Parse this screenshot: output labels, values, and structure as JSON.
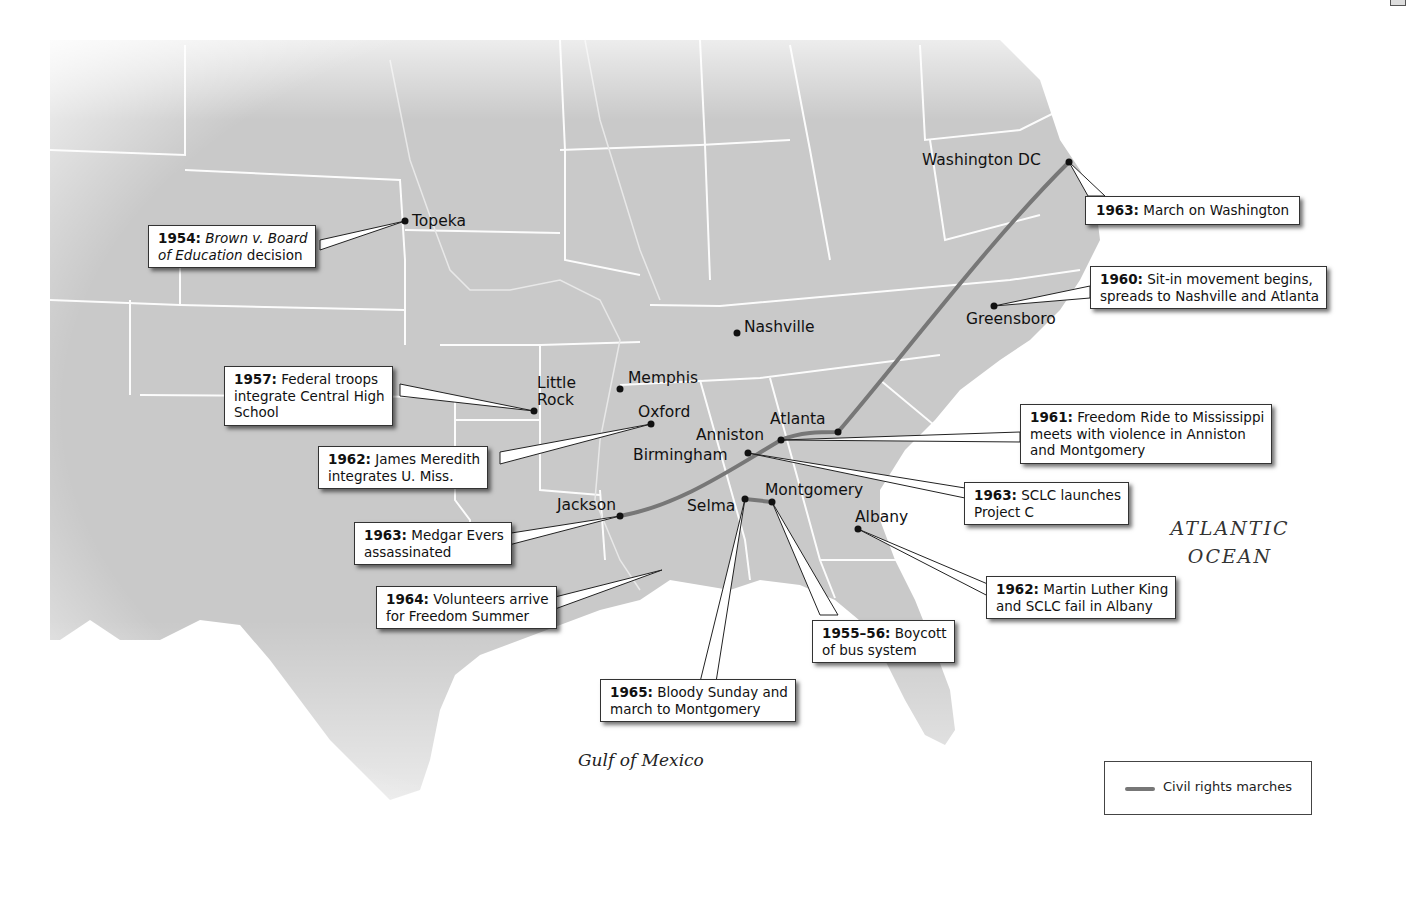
{
  "map": {
    "title": "Civil Rights Movement",
    "colors": {
      "land": "#c8c8c8",
      "water": "#f4f4f4",
      "borders": "#ffffff",
      "march_route": "#7a7a7a"
    },
    "cities": {
      "topeka": "Topeka",
      "washington_dc": "Washington DC",
      "greensboro": "Greensboro",
      "nashville": "Nashville",
      "memphis": "Memphis",
      "little_rock_line1": "Little",
      "little_rock_line2": "Rock",
      "oxford": "Oxford",
      "atlanta": "Atlanta",
      "anniston": "Anniston",
      "birmingham": "Birmingham",
      "jackson": "Jackson",
      "selma": "Selma",
      "montgomery": "Montgomery",
      "albany": "Albany"
    },
    "callouts": {
      "brown_v_board": {
        "year": "1954:",
        "italic": "Brown v. Board",
        "line2_italic": "of Education",
        "line2_rest": " decision"
      },
      "march_on_washington": {
        "year": "1963:",
        "text": " March on Washington"
      },
      "sit_in": {
        "year": "1960:",
        "line1": " Sit-in movement begins,",
        "line2": "spreads to Nashville and Atlanta"
      },
      "central_high": {
        "year": "1957:",
        "line1": " Federal troops",
        "line2": "integrate Central High",
        "line3": "School"
      },
      "meredith": {
        "year": "1962:",
        "line1": " James Meredith",
        "line2": "integrates U. Miss."
      },
      "freedom_ride": {
        "year": "1961:",
        "line1": " Freedom Ride to Mississippi",
        "line2": "meets with violence in Anniston",
        "line3": "and Montgomery"
      },
      "project_c": {
        "year": "1963:",
        "line1": " SCLC launches",
        "line2": "Project C"
      },
      "medgar_evers": {
        "year": "1963:",
        "line1": " Medgar Evers",
        "line2": "assassinated"
      },
      "freedom_summer": {
        "year": "1964:",
        "line1": " Volunteers arrive",
        "line2": "for Freedom Summer"
      },
      "albany": {
        "year": "1962:",
        "line1": " Martin Luther King",
        "line2": "and SCLC fail in Albany"
      },
      "bus_boycott": {
        "year": "1955–56:",
        "line1": " Boycott",
        "line2": "of bus system"
      },
      "bloody_sunday": {
        "year": "1965:",
        "line1": " Bloody Sunday and",
        "line2": "march to Montgomery"
      }
    },
    "water_labels": {
      "atlantic_line1": "ATLANTIC",
      "atlantic_line2": "OCEAN",
      "gulf": "Gulf of Mexico"
    },
    "legend": {
      "march_label": "Civil rights marches"
    }
  }
}
